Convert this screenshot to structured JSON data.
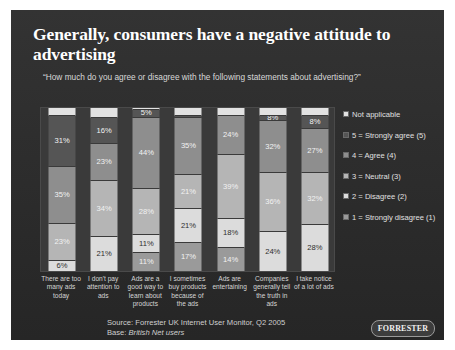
{
  "slide": {
    "title": "Generally, consumers have a negative attitude to advertising",
    "subtitle": "“How much do you agree or disagree with the following statements about advertising?”",
    "source": "Source: Forrester UK Internet User Monitor, Q2 2005",
    "base_prefix": "Base: ",
    "base_value": "British Net users",
    "logo": "FORRESTER",
    "background": "#2c2c2c"
  },
  "legend": {
    "position": "right",
    "items": [
      {
        "label": "Not applicable",
        "color": "#e2e2e2"
      },
      {
        "label": "5 = Strongly agree (5)",
        "color": "#555555"
      },
      {
        "label": "4 = Agree (4)",
        "color": "#8e8e8e"
      },
      {
        "label": "3 = Neutral (3)",
        "color": "#b5b5b5"
      },
      {
        "label": "2 = Disagree (2)",
        "color": "#dcdcdc"
      },
      {
        "label": "1 = Strongly disagree (1)",
        "color": "#9a9a9a"
      }
    ]
  },
  "chart_data": {
    "type": "bar",
    "subtype": "stacked-100-percent",
    "title": "Generally, consumers have a negative attitude to advertising",
    "subtitle": "“How much do you agree or disagree with the following statements about advertising?”",
    "xlabel": "",
    "ylabel": "",
    "ylim": [
      0,
      100
    ],
    "grid": false,
    "legend_position": "right",
    "categories": [
      "There are too many ads today",
      "I don't pay attention to ads",
      "Ads are a good way to learn about products",
      "I sometimes buy products because of the ads",
      "Ads are entertaining",
      "Companies generally tell the truth in ads",
      "I take notice of a lot of ads"
    ],
    "series": [
      {
        "name": "Not applicable",
        "color": "#e2e2e2",
        "values": [
          5,
          6,
          5,
          5,
          5,
          5,
          5
        ]
      },
      {
        "name": "5 = Strongly agree (5)",
        "color": "#555555",
        "values": [
          31,
          16,
          5,
          11,
          5,
          8,
          8
        ]
      },
      {
        "name": "4 = Agree (4)",
        "color": "#8e8e8e",
        "values": [
          35,
          23,
          44,
          35,
          24,
          32,
          27
        ]
      },
      {
        "name": "3 = Neutral (3)",
        "color": "#b5b5b5",
        "values": [
          23,
          34,
          28,
          21,
          39,
          36,
          32
        ]
      },
      {
        "name": "2 = Disagree (2)",
        "color": "#dcdcdc",
        "values": [
          6,
          21,
          11,
          21,
          18,
          24,
          28
        ]
      },
      {
        "name": "1 = Strongly disagree (1)",
        "color": "#9a9a9a",
        "values": [
          0,
          0,
          11,
          17,
          14,
          0,
          0
        ]
      }
    ],
    "bars": [
      {
        "category": "There are too many ads today",
        "segments": [
          {
            "series": "Not applicable",
            "value": 5,
            "label": "",
            "color": "#e2e2e2"
          },
          {
            "series": "5 = Strongly agree (5)",
            "value": 31,
            "label": "31%",
            "color": "#555555"
          },
          {
            "series": "4 = Agree (4)",
            "value": 35,
            "label": "35%",
            "color": "#8e8e8e"
          },
          {
            "series": "3 = Neutral (3)",
            "value": 23,
            "label": "23%",
            "color": "#b5b5b5"
          },
          {
            "series": "2 = Disagree (2)",
            "value": 6,
            "label": "6%",
            "color": "#dcdcdc"
          }
        ]
      },
      {
        "category": "I don't pay attention to ads",
        "segments": [
          {
            "series": "Not applicable",
            "value": 6,
            "label": "",
            "color": "#e2e2e2"
          },
          {
            "series": "5 = Strongly agree (5)",
            "value": 16,
            "label": "16%",
            "color": "#555555"
          },
          {
            "series": "4 = Agree (4)",
            "value": 23,
            "label": "23%",
            "color": "#8e8e8e"
          },
          {
            "series": "3 = Neutral (3)",
            "value": 34,
            "label": "34%",
            "color": "#b5b5b5"
          },
          {
            "series": "2 = Disagree (2)",
            "value": 21,
            "label": "21%",
            "color": "#dcdcdc"
          }
        ]
      },
      {
        "category": "Ads are a good way to learn about products",
        "segments": [
          {
            "series": "Not applicable",
            "value": 1,
            "label": "",
            "color": "#e2e2e2"
          },
          {
            "series": "5 = Strongly agree (5)",
            "value": 5,
            "label": "5%",
            "color": "#555555"
          },
          {
            "series": "4 = Agree (4)",
            "value": 44,
            "label": "44%",
            "color": "#8e8e8e"
          },
          {
            "series": "3 = Neutral (3)",
            "value": 28,
            "label": "28%",
            "color": "#b5b5b5"
          },
          {
            "series": "2 = Disagree (2)",
            "value": 11,
            "label": "11%",
            "color": "#dcdcdc"
          },
          {
            "series": "1 = Strongly disagree (1)",
            "value": 11,
            "label": "11%",
            "color": "#9a9a9a"
          }
        ]
      },
      {
        "category": "I sometimes buy products because of the ads",
        "segments": [
          {
            "series": "Not applicable",
            "value": 5,
            "label": "",
            "color": "#e2e2e2"
          },
          {
            "series": "5 = Strongly agree (5)",
            "value": 1,
            "label": "",
            "color": "#555555"
          },
          {
            "series": "4 = Agree (4)",
            "value": 35,
            "label": "35%",
            "color": "#8e8e8e"
          },
          {
            "series": "3 = Neutral (3)",
            "value": 21,
            "label": "21%",
            "color": "#b5b5b5"
          },
          {
            "series": "2 = Disagree (2)",
            "value": 21,
            "label": "21%",
            "color": "#dcdcdc"
          },
          {
            "series": "1 = Strongly disagree (1)",
            "value": 17,
            "label": "17%",
            "color": "#9a9a9a"
          }
        ]
      },
      {
        "category": "Ads are entertaining",
        "segments": [
          {
            "series": "Not applicable",
            "value": 5,
            "label": "",
            "color": "#e2e2e2"
          },
          {
            "series": "4 = Agree (4)",
            "value": 24,
            "label": "24%",
            "color": "#8e8e8e"
          },
          {
            "series": "3 = Neutral (3)",
            "value": 39,
            "label": "39%",
            "color": "#b5b5b5"
          },
          {
            "series": "2 = Disagree (2)",
            "value": 18,
            "label": "18%",
            "color": "#dcdcdc"
          },
          {
            "series": "1 = Strongly disagree (1)",
            "value": 14,
            "label": "14%",
            "color": "#9a9a9a"
          }
        ]
      },
      {
        "category": "Companies generally tell the truth in ads",
        "segments": [
          {
            "series": "Not applicable",
            "value": 5,
            "label": "",
            "color": "#e2e2e2"
          },
          {
            "series": "5 = Strongly agree (5)",
            "value": 3,
            "label": "8%",
            "color": "#555555"
          },
          {
            "series": "4 = Agree (4)",
            "value": 32,
            "label": "32%",
            "color": "#8e8e8e"
          },
          {
            "series": "3 = Neutral (3)",
            "value": 36,
            "label": "36%",
            "color": "#b5b5b5"
          },
          {
            "series": "2 = Disagree (2)",
            "value": 24,
            "label": "24%",
            "color": "#dcdcdc"
          }
        ]
      },
      {
        "category": "I take notice of a lot of ads",
        "segments": [
          {
            "series": "Not applicable",
            "value": 5,
            "label": "",
            "color": "#e2e2e2"
          },
          {
            "series": "5 = Strongly agree (5)",
            "value": 8,
            "label": "8%",
            "color": "#555555"
          },
          {
            "series": "4 = Agree (4)",
            "value": 27,
            "label": "27%",
            "color": "#8e8e8e"
          },
          {
            "series": "3 = Neutral (3)",
            "value": 32,
            "label": "32%",
            "color": "#b5b5b5"
          },
          {
            "series": "2 = Disagree (2)",
            "value": 28,
            "label": "28%",
            "color": "#dcdcdc"
          }
        ]
      }
    ]
  }
}
